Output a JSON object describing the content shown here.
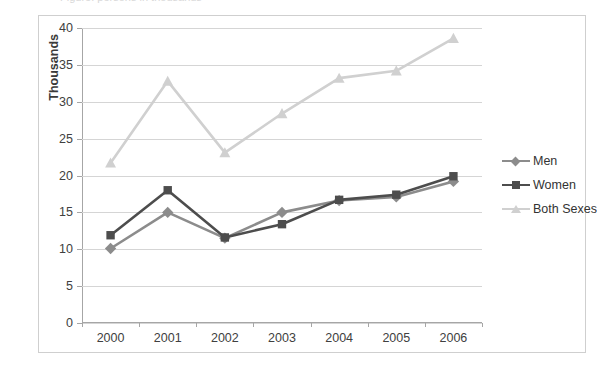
{
  "top_partial_text": "Figure: persons in thousands",
  "chart_data": {
    "type": "line",
    "title": "",
    "xlabel": "",
    "ylabel": "Thousands",
    "categories": [
      "2000",
      "2001",
      "2002",
      "2003",
      "2004",
      "2005",
      "2006"
    ],
    "ylim": [
      0,
      40
    ],
    "ytick_step": 5,
    "yticks": [
      "40",
      "35",
      "30",
      "25",
      "20",
      "15",
      "10",
      "5",
      "0"
    ],
    "grid": true,
    "legend_position": "right",
    "series": [
      {
        "name": "Men",
        "color": "#8c8c8c",
        "marker": "diamond",
        "values": [
          10.1,
          15.0,
          11.5,
          15.0,
          16.6,
          17.1,
          19.2
        ]
      },
      {
        "name": "Women",
        "color": "#4d4d4d",
        "marker": "square",
        "values": [
          11.9,
          18.0,
          11.6,
          13.4,
          16.7,
          17.4,
          19.9
        ]
      },
      {
        "name": "Both Sexes",
        "color": "#d0d0d0",
        "marker": "triangle",
        "values": [
          21.7,
          32.8,
          23.1,
          28.4,
          33.2,
          34.2,
          38.6
        ]
      }
    ]
  },
  "colors": {
    "frame_border": "#cfcfcf",
    "gridline": "#d5d5d5",
    "axis": "#a6a6a6",
    "text": "#404040"
  }
}
